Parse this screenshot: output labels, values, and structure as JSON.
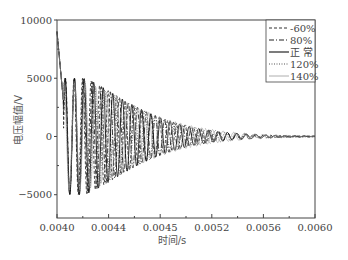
{
  "chart_data": {
    "type": "line",
    "title": "",
    "xlabel": "时间/s",
    "ylabel": "电压幅值/V",
    "xlim": [
      0.004,
      0.006
    ],
    "ylim": [
      -7000,
      10000
    ],
    "x_ticks": [
      "0.0040",
      "0.0044",
      "0.0045",
      "0.0052",
      "0.0056",
      "0.0060"
    ],
    "y_ticks": [
      "10000",
      "5000",
      "0",
      "-5000"
    ],
    "grid": false,
    "legend_position": "top-right",
    "series": [
      {
        "name": "-60%",
        "style": "dashed",
        "freq_scale": 1.12,
        "phase": 0.0,
        "peak": 5000,
        "decay": 0.00055
      },
      {
        "name": "80%",
        "style": "dashdot",
        "freq_scale": 1.06,
        "phase": 0.5,
        "peak": 5000,
        "decay": 0.00055
      },
      {
        "name": "正 常",
        "style": "solid",
        "freq_scale": 1.0,
        "phase": 1.0,
        "peak": 5000,
        "decay": 0.00055
      },
      {
        "name": "120%",
        "style": "dotted",
        "freq_scale": 0.95,
        "phase": 1.6,
        "peak": 4800,
        "decay": 0.00058
      },
      {
        "name": "140%",
        "style": "thin",
        "freq_scale": 0.9,
        "phase": 2.2,
        "peak": 4600,
        "decay": 0.0006
      }
    ],
    "initial_spike": {
      "x": 0.004,
      "y": 9000
    },
    "base_frequency_hz": 13500
  },
  "legend": {
    "items": [
      "-60%",
      "80%",
      "正 常",
      "120%",
      "140%"
    ]
  }
}
